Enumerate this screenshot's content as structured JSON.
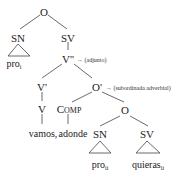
{
  "diagram": {
    "type": "syntax-tree",
    "nodes": {
      "root": "O",
      "sn_subject": "SN",
      "sn_subject_leaf": "pro",
      "sn_subject_index": "i",
      "sv": "SV",
      "v_double_bar": "V''",
      "v_double_bar_note": "→ (adjunto)",
      "v_bar": "V'",
      "v": "V",
      "v_leaf": "vamos,",
      "o_bar": "O'",
      "o_bar_note": "→ (subordinada adverbial)",
      "comp_first": "C",
      "comp_rest": "OMP",
      "comp_leaf": "adonde",
      "o_embedded": "O",
      "sn_embedded": "SN",
      "sn_embedded_leaf": "pro",
      "sn_embedded_index": "ii",
      "sv_embedded": "SV",
      "sv_embedded_leaf": "quieras",
      "sv_embedded_index": "ii"
    }
  }
}
